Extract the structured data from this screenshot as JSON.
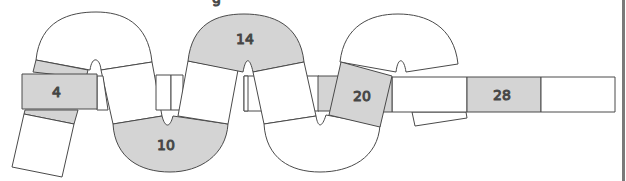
{
  "figure": {
    "top_cut_text": "g",
    "colors": {
      "stroke": "#4a4a4a",
      "shaded": "#d4d4d4",
      "unshaded": "#ffffff",
      "label": "#333333",
      "right_edge_bar": "#7a7a7a"
    },
    "labels": {
      "tile_4": "4",
      "tile_10": "10",
      "tile_14": "14",
      "tile_20": "20",
      "tile_28": "28"
    }
  }
}
